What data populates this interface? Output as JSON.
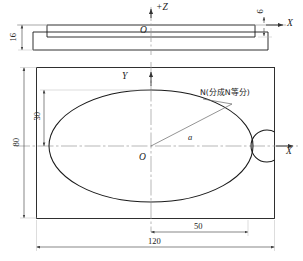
{
  "drawing": {
    "title": "Mechanical part drawing - elliptical cam plate",
    "stroke_color": "#1a1a1a",
    "center_line_color": "#9a9a9a",
    "dimension_line_color": "#555555"
  },
  "top_view": {
    "name": "side elevation",
    "axis_z_label": "+Z",
    "axis_x_label": "X",
    "origin_label": "O",
    "thickness_dim": "16",
    "step_dim": "6"
  },
  "main_view": {
    "name": "plan view",
    "axis_y_label": "Y",
    "axis_x_label": "X",
    "origin_label": "O",
    "radius_label": "a",
    "annotation": "N(分成N等分)",
    "dim_height_inner": "30",
    "dim_height_total": "80",
    "dim_width_half": "50",
    "dim_width_total": "120"
  }
}
